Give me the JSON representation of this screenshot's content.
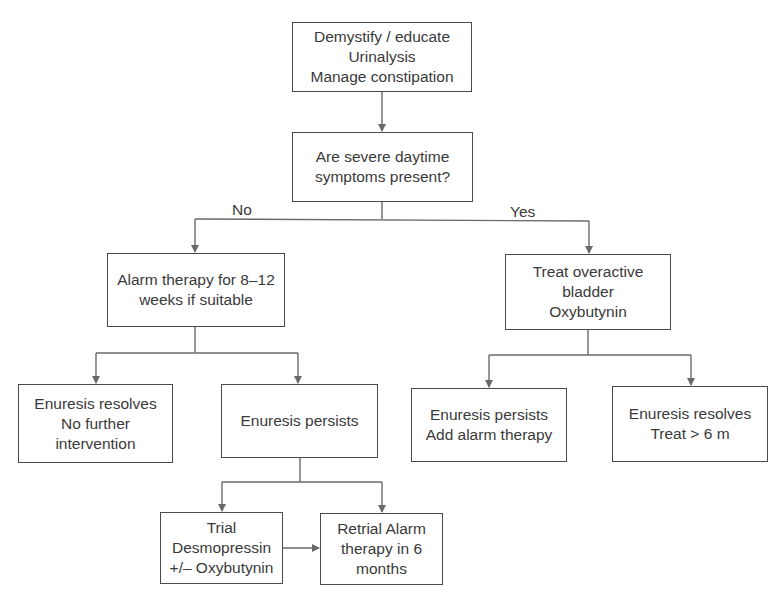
{
  "flowchart": {
    "nodes": {
      "start": {
        "lines": [
          "Demystify / educate",
          "Urinalysis",
          "Manage constipation"
        ]
      },
      "question": {
        "lines": [
          "Are severe daytime",
          "symptoms present?"
        ]
      },
      "alarm": {
        "lines": [
          "Alarm therapy for 8–12",
          "weeks if suitable"
        ]
      },
      "oab": {
        "lines": [
          "Treat overactive",
          "bladder",
          "Oxybutynin"
        ]
      },
      "resolves_left": {
        "lines": [
          "Enuresis resolves",
          "No further",
          "intervention"
        ]
      },
      "persists_left": {
        "lines": [
          "Enuresis persists"
        ]
      },
      "persists_right": {
        "lines": [
          "Enuresis persists",
          "Add alarm therapy"
        ]
      },
      "resolves_right": {
        "lines": [
          "Enuresis resolves",
          "Treat > 6 m"
        ]
      },
      "trial": {
        "lines": [
          "Trial",
          "Desmopressin",
          "+/– Oxybutynin"
        ]
      },
      "retrial": {
        "lines": [
          "Retrial Alarm",
          "therapy in 6",
          "months"
        ]
      }
    },
    "branch_labels": {
      "no": "No",
      "yes": "Yes"
    },
    "edges": [
      [
        "start",
        "question"
      ],
      [
        "question",
        "alarm",
        "No"
      ],
      [
        "question",
        "oab",
        "Yes"
      ],
      [
        "alarm",
        "resolves_left"
      ],
      [
        "alarm",
        "persists_left"
      ],
      [
        "oab",
        "persists_right"
      ],
      [
        "oab",
        "resolves_right"
      ],
      [
        "persists_left",
        "trial"
      ],
      [
        "persists_left",
        "retrial"
      ],
      [
        "trial",
        "retrial"
      ]
    ],
    "colors": {
      "line": "#6a6a6a",
      "border": "#4a4a4a",
      "text": "#3a3a3a"
    }
  }
}
